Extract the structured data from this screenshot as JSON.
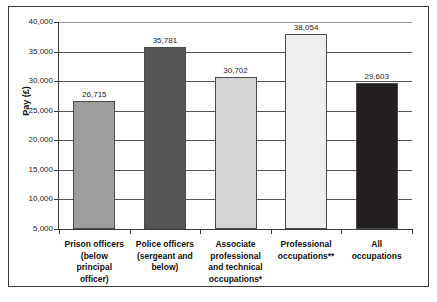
{
  "chart_data": {
    "type": "bar",
    "title": "",
    "xlabel": "",
    "ylabel": "Pay (£)",
    "ylim": [
      5000,
      40000
    ],
    "grid": true,
    "legend": "none",
    "orientation": "vertical",
    "categories": [
      "Prison officers (below principal officer)",
      "Police officers (sergeant and below)",
      "Associate professional and technical occupations*",
      "Professional occupations**",
      "All occupations"
    ],
    "values": [
      26715,
      35781,
      30702,
      38054,
      29603
    ],
    "value_labels": [
      "26,715",
      "35,781",
      "30,702",
      "38,054",
      "29,603"
    ],
    "ytick_values": [
      40000,
      35000,
      30000,
      25000,
      20000,
      15000,
      10000,
      5000
    ],
    "ytick_labels": [
      "40,000",
      "35,000",
      "30,000",
      "25,000",
      "20,000",
      "15,000",
      "10,000",
      "5,000"
    ],
    "bar_colors": [
      "#9d9d9d",
      "#565656",
      "#d4d4d4",
      "#efefef",
      "#231f20"
    ],
    "bar_outline": "#4a4a4a"
  },
  "axes": {
    "y_title": "Pay (£)"
  },
  "categories_lines": [
    [
      "Prison officers",
      "(below",
      "principal",
      "officer)"
    ],
    [
      "Police officers",
      "(sergeant and",
      "below)"
    ],
    [
      "Associate",
      "professional",
      "and technical",
      "occupations*"
    ],
    [
      "Professional",
      "occupations**"
    ],
    [
      "All",
      "occupations"
    ]
  ]
}
